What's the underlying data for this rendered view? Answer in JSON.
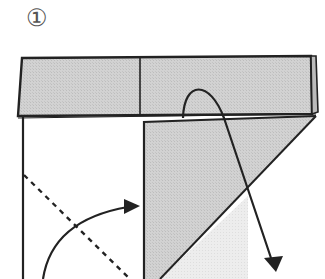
{
  "step": {
    "label": "①"
  },
  "colors": {
    "paper_gray": "#cfcfcf",
    "paper_light": "#ececec",
    "line": "#222222",
    "background": "#ffffff"
  },
  "diagram": {
    "elements": [
      {
        "name": "top-band-folded-strip",
        "fill": "gray"
      },
      {
        "name": "left-white-panel",
        "fill": "white"
      },
      {
        "name": "triangular-gray-flap",
        "fill": "gray"
      },
      {
        "name": "valley-fold-dashed-line",
        "style": "dashed"
      },
      {
        "name": "fold-up-curved-arrow",
        "direction": "bottom-left to right"
      },
      {
        "name": "unfold-arch-arrow",
        "direction": "from band down to bottom-right"
      }
    ]
  }
}
